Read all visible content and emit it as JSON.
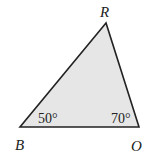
{
  "diagram": {
    "type": "triangle",
    "fill_color": "#e6e6e6",
    "stroke_color": "#222222",
    "vertices": [
      {
        "name": "R",
        "x": 106,
        "y": 23
      },
      {
        "name": "B",
        "x": 20,
        "y": 127
      },
      {
        "name": "O",
        "x": 139,
        "y": 127
      }
    ],
    "vertex_labels": {
      "R": "R",
      "B": "B",
      "O": "O"
    },
    "angles": {
      "B": "50°",
      "O": "70°"
    }
  }
}
